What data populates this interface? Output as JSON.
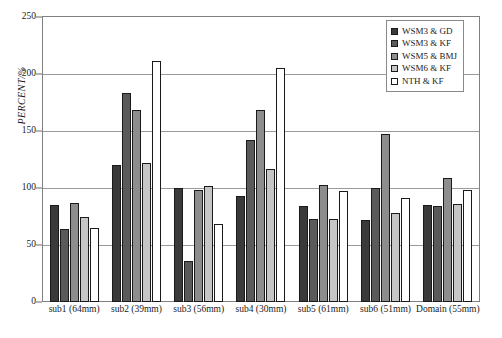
{
  "chart_data": {
    "type": "bar",
    "title": "",
    "xlabel": "",
    "ylabel": "PERCENT/%",
    "ylim": [
      0,
      250
    ],
    "yticks": [
      0,
      50,
      100,
      150,
      200,
      250
    ],
    "grid": true,
    "legend_position": "top-right",
    "categories": [
      "sub1 (64mm)",
      "sub2 (39mm)",
      "sub3 (56mm)",
      "sub4 (30mm)",
      "sub5 (61mm)",
      "sub6 (51mm)",
      "Domain (55mm)"
    ],
    "series": [
      {
        "name": "WSM3 & GD",
        "color": "#3a3a3a",
        "border": "#1a1a1a",
        "values": [
          85,
          120,
          100,
          93,
          84,
          72,
          85
        ]
      },
      {
        "name": "WSM3 &  KF",
        "color": "#5a5a5a",
        "border": "#1a1a1a",
        "values": [
          64,
          183,
          36,
          142,
          73,
          100,
          84
        ]
      },
      {
        "name": "WSM5 & BMJ",
        "color": "#8d8d8d",
        "border": "#1a1a1a",
        "values": [
          87,
          168,
          98,
          168,
          103,
          147,
          109
        ]
      },
      {
        "name": "WSM6 & KF",
        "color": "#c6c6c6",
        "border": "#1a1a1a",
        "values": [
          75,
          122,
          102,
          117,
          73,
          78,
          86
        ]
      },
      {
        "name": "NTH & KF",
        "color": "#ffffff",
        "border": "#1a1a1a",
        "values": [
          65,
          211,
          68,
          205,
          97,
          91,
          98
        ]
      }
    ]
  }
}
